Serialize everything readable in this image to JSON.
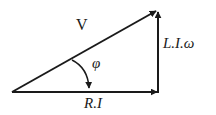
{
  "diagram": {
    "colors": {
      "stroke": "#1a1a1a",
      "background": "#ffffff"
    },
    "vectors": [
      {
        "id": "V",
        "label": "V",
        "from": [
          12,
          92
        ],
        "to": [
          158,
          10
        ]
      },
      {
        "id": "RI",
        "label": "R.I",
        "from": [
          12,
          92
        ],
        "to": [
          158,
          92
        ]
      },
      {
        "id": "LIw",
        "label": "L.I.ω",
        "from": [
          158,
          92
        ],
        "to": [
          158,
          10
        ]
      }
    ],
    "angle": {
      "label": "φ",
      "between": [
        "V",
        "RI"
      ]
    },
    "labels": {
      "v": "V",
      "phi": "φ",
      "liw": "L.I.ω",
      "ri": "R.I"
    }
  }
}
